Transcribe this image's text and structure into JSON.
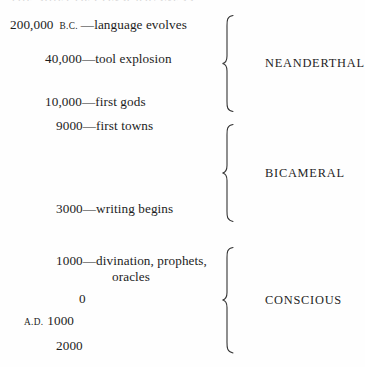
{
  "figure": {
    "caption_remnant": "THE SHIFT OF CONSCIOUSNESS",
    "background_color": "#fefefe",
    "text_color": "#1c1c1c"
  },
  "timeline": {
    "entries": [
      {
        "era": "B.C.",
        "era_position": "after",
        "number": "200,000",
        "dash": "—",
        "event": "language evolves",
        "event_line2": ""
      },
      {
        "era": "",
        "era_position": "",
        "number": "40,000",
        "dash": "—",
        "event": "tool explosion",
        "event_line2": ""
      },
      {
        "era": "",
        "era_position": "",
        "number": "10,000",
        "dash": "—",
        "event": "first gods",
        "event_line2": ""
      },
      {
        "era": "",
        "era_position": "",
        "number": "9000",
        "dash": "—",
        "event": "first towns",
        "event_line2": ""
      },
      {
        "era": "",
        "era_position": "",
        "number": "3000",
        "dash": "—",
        "event": "writing begins",
        "event_line2": ""
      },
      {
        "era": "",
        "era_position": "",
        "number": "1000",
        "dash": "—",
        "event": "divination, prophets,",
        "event_line2": "oracles"
      },
      {
        "era": "",
        "era_position": "",
        "number": "0",
        "dash": "",
        "event": "",
        "event_line2": ""
      },
      {
        "era": "A.D.",
        "era_position": "before",
        "number": "1000",
        "dash": "",
        "event": "",
        "event_line2": ""
      },
      {
        "era": "",
        "era_position": "",
        "number": "2000",
        "dash": "",
        "event": "",
        "event_line2": ""
      }
    ]
  },
  "groups": [
    {
      "label": "NEANDERTHAL"
    },
    {
      "label": "BICAMERAL"
    },
    {
      "label": "CONSCIOUS"
    }
  ]
}
